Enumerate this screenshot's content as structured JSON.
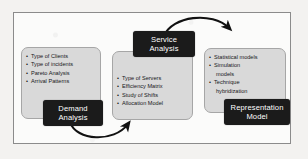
{
  "diagram": {
    "background_color": "#fbfbfa",
    "panel_color": "#d9d9d9",
    "label_color": "#1b1b1b",
    "arrow_color": "#111111",
    "stages": [
      {
        "key": "demand",
        "label": "Demand\nAnalysis",
        "label_line1": "Demand",
        "label_line2": "Analysis",
        "bullets": [
          "Type of Clients",
          "Type of incidents",
          "Pareto Analysis",
          "Arrival Patterns"
        ]
      },
      {
        "key": "service",
        "label": "Service\nAnalysis",
        "label_line1": "Service",
        "label_line2": "Analysis",
        "bullets": [
          "Type of Servers",
          "Efficiency Matrix",
          "Study of Shifts",
          "Allocation Model"
        ]
      },
      {
        "key": "representation",
        "label": "Representation\nModel",
        "label_line1": "Representation",
        "label_line2": "Model",
        "bullets": [
          "Statistical models",
          "Simulation",
          "models",
          "Technique",
          "hybridization"
        ],
        "bullet_flags": [
          true,
          true,
          false,
          true,
          false
        ]
      }
    ],
    "arrows": [
      {
        "name": "demand-to-service",
        "from": "Demand Analysis",
        "to": "Service Analysis",
        "direction": "clockwise-bottom"
      },
      {
        "name": "service-to-representation",
        "from": "Service Analysis",
        "to": "Representation Model",
        "direction": "clockwise-top"
      }
    ]
  }
}
